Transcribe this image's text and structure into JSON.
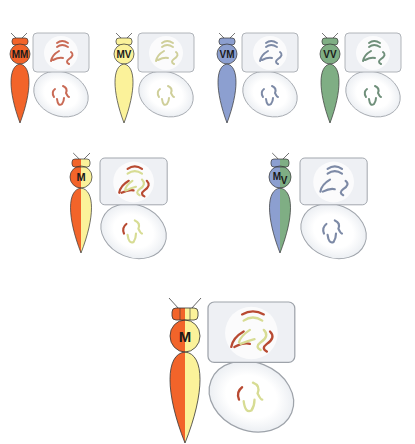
{
  "diagram": {
    "type": "genetic-cross-illustration",
    "colors": {
      "orange": "#f2642a",
      "yellow": "#fbf29a",
      "blue": "#8c9fd0",
      "green": "#7fae84",
      "chromo_orange": "#c96a55",
      "chromo_yellow": "#cfcf9a",
      "chromo_blue": "#7d8aa6",
      "chromo_green": "#6f8f7a",
      "chromo_red": "#b84a32",
      "chromo_cream": "#d7dc94",
      "box_fill": "#eef0f4",
      "box_stroke": "#9ea3aa"
    },
    "rows": [
      {
        "name": "parents",
        "items": [
          {
            "label": "MM",
            "body": "orange",
            "chromo": "chromo_orange"
          },
          {
            "label": "MV",
            "body": "yellow",
            "chromo": "chromo_yellow"
          },
          {
            "label": "VM",
            "body": "blue",
            "chromo": "chromo_blue"
          },
          {
            "label": "VV",
            "body": "green",
            "chromo": "chromo_green"
          }
        ]
      },
      {
        "name": "hybrids",
        "items": [
          {
            "label": "M",
            "body": "orange-yellow"
          },
          {
            "label_main": "M",
            "label_sub": "V",
            "body": "blue-green"
          }
        ]
      },
      {
        "name": "offspring",
        "items": [
          {
            "label": "M",
            "body": "orange-yellow"
          }
        ]
      }
    ]
  }
}
